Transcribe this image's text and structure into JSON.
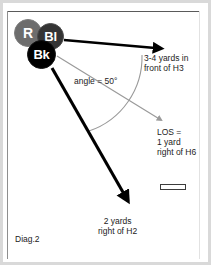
{
  "diagram": {
    "caption": "Diag.2",
    "players": [
      {
        "id": "r",
        "label": "R",
        "color": "#6d6d6d",
        "role": "receiver-marker"
      },
      {
        "id": "bl",
        "label": "Bl",
        "color": "#343434",
        "role": "blue-marker"
      },
      {
        "id": "bk",
        "label": "Bk",
        "color": "#000000",
        "role": "back-marker"
      }
    ],
    "annotations": {
      "top_route": "3-4 yards in\nfront of H3",
      "angle": "angle = 50°",
      "los": "LOS =\n1 yard\nright of H6",
      "bottom_route": "2 yards\nright of H2"
    },
    "ball_marker": "ball-marker",
    "arrows": [
      {
        "name": "top-route-arrow",
        "style": "thick-black",
        "from": [
          64,
          40
        ],
        "to": [
          165,
          49
        ]
      },
      {
        "name": "los-reference-arrow",
        "style": "thin-gray",
        "from": [
          57,
          56
        ],
        "to": [
          165,
          123
        ]
      },
      {
        "name": "bottom-route-arrow",
        "style": "thick-black",
        "from": [
          52,
          68
        ],
        "to": [
          132,
          206
        ]
      }
    ],
    "angle_arc": {
      "name": "angle-arc",
      "style": "thin-gray",
      "degrees": 50
    },
    "colors": {
      "frame": "#d9d9d9",
      "frame_line": "#5a5a5a",
      "thick_arrow": "#000000",
      "thin_arrow": "#9a9a9a",
      "text": "#1c1c1c",
      "background": "#ffffff"
    }
  }
}
